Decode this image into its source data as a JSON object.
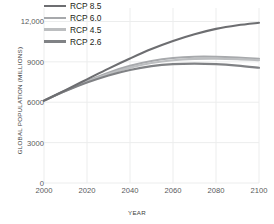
{
  "chart_data": {
    "type": "line",
    "title": "",
    "xlabel": "YEAR",
    "ylabel": "GLOBAL POPULATION (MILLIONS)",
    "xlim": [
      2000,
      2100
    ],
    "ylim": [
      0,
      13000
    ],
    "xticks": [
      "2000",
      "2020",
      "2040",
      "2060",
      "2080",
      "2100"
    ],
    "xtick_values": [
      2000,
      2020,
      2040,
      2060,
      2080,
      2100
    ],
    "yticks": [
      "0",
      "3000",
      "6000",
      "9000",
      "12,000"
    ],
    "ytick_values": [
      0,
      3000,
      6000,
      9000,
      12000
    ],
    "grid": true,
    "legend_position": "top-left",
    "x": [
      2000,
      2010,
      2020,
      2030,
      2040,
      2050,
      2060,
      2070,
      2080,
      2090,
      2100
    ],
    "series": [
      {
        "name": "RCP 8.5",
        "color": "#6d6e71",
        "values": [
          6120,
          6900,
          7700,
          8500,
          9250,
          9950,
          10550,
          11050,
          11450,
          11720,
          11900
        ]
      },
      {
        "name": "RCP 6.0",
        "color": "#a7a9ac",
        "values": [
          6120,
          6870,
          7580,
          8200,
          8700,
          9060,
          9280,
          9380,
          9380,
          9320,
          9230
        ]
      },
      {
        "name": "RCP 4.5",
        "color": "#bcbec0",
        "values": [
          6120,
          6850,
          7520,
          8100,
          8570,
          8910,
          9120,
          9220,
          9240,
          9200,
          9120
        ]
      },
      {
        "name": "RCP 2.6",
        "color": "#808285",
        "values": [
          6120,
          6830,
          7460,
          7990,
          8400,
          8680,
          8830,
          8870,
          8830,
          8720,
          8560
        ]
      }
    ]
  },
  "legend": {
    "items": [
      {
        "label": "RCP 8.5",
        "color": "#6d6e71"
      },
      {
        "label": "RCP 6.0",
        "color": "#a7a9ac"
      },
      {
        "label": "RCP 4.5",
        "color": "#bcbec0"
      },
      {
        "label": "RCP 2.6",
        "color": "#808285"
      }
    ]
  },
  "style": {
    "grid_color": "#eceded",
    "axis_text_color": "#58595b",
    "title_text_color": "#3d3d3d",
    "background": "#ffffff"
  }
}
